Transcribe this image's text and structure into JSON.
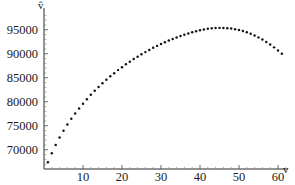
{
  "chart_data": {
    "type": "scatter",
    "title": "",
    "subtitle": "",
    "xlabel": "v",
    "ylabel": "v̂",
    "grid": false,
    "legend": null,
    "xlim": [
      0,
      63
    ],
    "ylim": [
      66000,
      98500
    ],
    "xticks": [
      10,
      20,
      30,
      40,
      50,
      60
    ],
    "xtick_labels": [
      "10",
      "20",
      "30",
      "40",
      "50",
      "60"
    ],
    "yticks": [
      70000,
      75000,
      80000,
      85000,
      90000,
      95000
    ],
    "ytick_labels": [
      "70000",
      "75000",
      "80000",
      "85000",
      "90000",
      "95000"
    ],
    "x_minor_tick_step": 2,
    "y_minor_tick_step": 1000,
    "marker": "point",
    "marker_size": 2,
    "marker_color": "#141414",
    "x": [
      1,
      2,
      3,
      4,
      5,
      6,
      7,
      8,
      9,
      10,
      11,
      12,
      13,
      14,
      15,
      16,
      17,
      18,
      19,
      20,
      21,
      22,
      23,
      24,
      25,
      26,
      27,
      28,
      29,
      30,
      31,
      32,
      33,
      34,
      35,
      36,
      37,
      38,
      39,
      40,
      41,
      42,
      43,
      44,
      45,
      46,
      47,
      48,
      49,
      50,
      51,
      52,
      53,
      54,
      55,
      56,
      57,
      58,
      59,
      60,
      61
    ],
    "y": [
      67400,
      69300,
      71000,
      72550,
      73950,
      75250,
      76450,
      77550,
      78600,
      79600,
      80550,
      81450,
      82300,
      83100,
      83850,
      84600,
      85300,
      85950,
      86600,
      87200,
      87800,
      88350,
      88900,
      89400,
      89900,
      90350,
      90800,
      91250,
      91650,
      92050,
      92400,
      92750,
      93100,
      93400,
      93700,
      93980,
      94230,
      94480,
      94700,
      94900,
      95070,
      95200,
      95300,
      95370,
      95400,
      95390,
      95340,
      95250,
      95120,
      94950,
      94730,
      94470,
      94170,
      93820,
      93420,
      92980,
      92480,
      91940,
      91340,
      90700,
      90000
    ],
    "series_name": "predicted values",
    "xlabel_position": "axis-end-right",
    "ylabel_position": "axis-end-top"
  },
  "axes_pixels": {
    "x_origin": 44,
    "y_baseline": 169,
    "x_per_unit": 3.9,
    "y_value_at_baseline": 66000,
    "px_per_1000": 4.8
  }
}
